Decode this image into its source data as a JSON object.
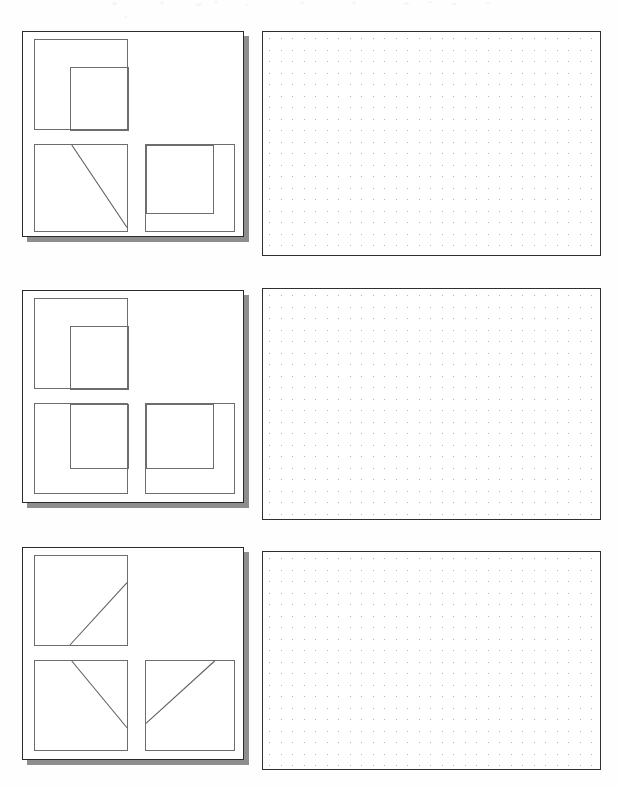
{
  "page": {
    "width": 619,
    "height": 788,
    "background_color": "#fefefe",
    "ink_color": "#2b2b2b",
    "shadow_color": "#8e8e8e",
    "dot_color": "#9a9a9a",
    "box_stroke_color": "#6d6d6d"
  },
  "rows": [
    {
      "id": "row-1",
      "label": "Row 1",
      "card": {
        "label": "Diagram Card 1",
        "x": 22,
        "y": 31,
        "w": 222,
        "h": 206,
        "boxes": [
          {
            "name": "top-left-box",
            "label": "Top left box",
            "x": 11,
            "y": 7,
            "w": 94,
            "h": 91,
            "content_type": "nested-rect",
            "inner": {
              "x": 35,
              "y": 27,
              "w": 59,
              "h": 64,
              "anchor": "bottom-right"
            }
          },
          {
            "name": "bottom-left-box",
            "label": "Bottom left box",
            "x": 11,
            "y": 112,
            "w": 94,
            "h": 88,
            "content_type": "diagonal",
            "line": {
              "x1": 40,
              "y1": 0,
              "x2": 100,
              "y2": 96
            }
          },
          {
            "name": "bottom-right-box",
            "label": "Bottom right box",
            "x": 122,
            "y": 112,
            "w": 90,
            "h": 88,
            "content_type": "nested-rect",
            "inner": {
              "x": 0,
              "y": 0,
              "w": 68,
              "h": 69,
              "anchor": "top-left"
            }
          }
        ]
      },
      "gridpad": {
        "label": "Answer dot grid 1",
        "x": 262,
        "y": 31,
        "w": 339,
        "h": 225,
        "dot_spacing": 11.5
      }
    },
    {
      "id": "row-2",
      "label": "Row 2",
      "card": {
        "label": "Diagram Card 2",
        "x": 22,
        "y": 290,
        "w": 222,
        "h": 213,
        "boxes": [
          {
            "name": "top-left-box",
            "label": "Top left box",
            "x": 11,
            "y": 7,
            "w": 94,
            "h": 91,
            "content_type": "nested-rect",
            "inner": {
              "x": 35,
              "y": 27,
              "w": 59,
              "h": 64,
              "anchor": "bottom-right"
            }
          },
          {
            "name": "bottom-left-box",
            "label": "Bottom left box",
            "x": 11,
            "y": 112,
            "w": 94,
            "h": 91,
            "content_type": "nested-rect",
            "inner": {
              "x": 35,
              "y": 0,
              "w": 59,
              "h": 65,
              "anchor": "top-right"
            }
          },
          {
            "name": "bottom-right-box",
            "label": "Bottom right box",
            "x": 122,
            "y": 112,
            "w": 90,
            "h": 91,
            "content_type": "nested-rect",
            "inner": {
              "x": 0,
              "y": 0,
              "w": 68,
              "h": 65,
              "anchor": "top-left"
            }
          }
        ]
      },
      "gridpad": {
        "label": "Answer dot grid 2",
        "x": 262,
        "y": 288,
        "w": 339,
        "h": 232,
        "dot_spacing": 11.5
      }
    },
    {
      "id": "row-3",
      "label": "Row 3",
      "card": {
        "label": "Diagram Card 3",
        "x": 22,
        "y": 547,
        "w": 222,
        "h": 213,
        "boxes": [
          {
            "name": "top-left-box",
            "label": "Top left box",
            "x": 11,
            "y": 7,
            "w": 94,
            "h": 91,
            "content_type": "diagonal",
            "line": {
              "x1": 38,
              "y1": 100,
              "x2": 100,
              "y2": 30
            }
          },
          {
            "name": "bottom-left-box",
            "label": "Bottom left box",
            "x": 11,
            "y": 112,
            "w": 94,
            "h": 91,
            "content_type": "diagonal",
            "line": {
              "x1": 40,
              "y1": 0,
              "x2": 100,
              "y2": 75
            }
          },
          {
            "name": "bottom-right-box",
            "label": "Bottom right box",
            "x": 122,
            "y": 112,
            "w": 90,
            "h": 91,
            "content_type": "diagonal",
            "line": {
              "x1": 0,
              "y1": 70,
              "x2": 78,
              "y2": 0
            }
          }
        ]
      },
      "gridpad": {
        "label": "Answer dot grid 3",
        "x": 262,
        "y": 551,
        "w": 339,
        "h": 219,
        "dot_spacing": 11.5
      }
    }
  ],
  "artifacts": [
    {
      "x": 112,
      "y": 2,
      "w": 5,
      "h": 3
    },
    {
      "x": 160,
      "y": 1,
      "w": 4,
      "h": 3
    },
    {
      "x": 196,
      "y": 3,
      "w": 6,
      "h": 3
    },
    {
      "x": 214,
      "y": 1,
      "w": 4,
      "h": 2
    },
    {
      "x": 246,
      "y": 4,
      "w": 3,
      "h": 2
    },
    {
      "x": 300,
      "y": 2,
      "w": 5,
      "h": 2
    },
    {
      "x": 352,
      "y": 1,
      "w": 4,
      "h": 3
    },
    {
      "x": 404,
      "y": 2,
      "w": 5,
      "h": 3
    },
    {
      "x": 428,
      "y": 1,
      "w": 4,
      "h": 2
    },
    {
      "x": 452,
      "y": 3,
      "w": 5,
      "h": 2
    },
    {
      "x": 486,
      "y": 2,
      "w": 4,
      "h": 2
    },
    {
      "x": 124,
      "y": 16,
      "w": 3,
      "h": 2
    }
  ]
}
